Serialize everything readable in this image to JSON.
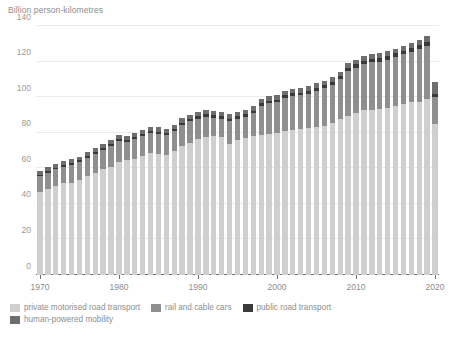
{
  "chart_data": {
    "type": "bar",
    "stacked": true,
    "title": "",
    "subtitle": "",
    "ylabel": "Billion person-kilometres",
    "xlabel": "",
    "ylim": [
      0,
      140
    ],
    "yticks": [
      0,
      20,
      40,
      60,
      80,
      100,
      120,
      140
    ],
    "xticks": [
      "1970",
      "1980",
      "1990",
      "2000",
      "2010",
      "2020"
    ],
    "grid": true,
    "legend_position": "bottom-left",
    "categories": [
      "1970",
      "1971",
      "1972",
      "1973",
      "1974",
      "1975",
      "1976",
      "1977",
      "1978",
      "1979",
      "1980",
      "1981",
      "1982",
      "1983",
      "1984",
      "1985",
      "1986",
      "1987",
      "1988",
      "1989",
      "1990",
      "1991",
      "1992",
      "1993",
      "1994",
      "1995",
      "1996",
      "1997",
      "1998",
      "1999",
      "2000",
      "2001",
      "2002",
      "2003",
      "2004",
      "2005",
      "2006",
      "2007",
      "2008",
      "2009",
      "2010",
      "2011",
      "2012",
      "2013",
      "2014",
      "2015",
      "2016",
      "2017",
      "2018",
      "2019",
      "2020"
    ],
    "series": [
      {
        "name": "private motorised road transport",
        "color": "#cfcfcf",
        "values": [
          46.5,
          48.5,
          50.0,
          51.5,
          52.0,
          53.5,
          55.5,
          57.5,
          59.5,
          61.0,
          63.5,
          64.5,
          65.5,
          67.0,
          68.5,
          68.0,
          67.5,
          69.5,
          72.5,
          74.5,
          76.5,
          77.5,
          78.0,
          77.5,
          73.5,
          76.0,
          77.0,
          78.0,
          78.5,
          79.5,
          80.0,
          81.0,
          81.5,
          82.0,
          82.5,
          83.5,
          84.0,
          85.5,
          87.5,
          89.5,
          91.0,
          92.5,
          93.0,
          93.5,
          94.0,
          95.0,
          96.0,
          97.0,
          97.5,
          99.0,
          85.0
        ]
      },
      {
        "name": "rail and cable cars",
        "color": "#8f8f8f",
        "values": [
          9.0,
          9.0,
          9.5,
          9.5,
          10.0,
          10.0,
          10.5,
          10.5,
          11.0,
          11.5,
          12.0,
          10.5,
          11.0,
          11.0,
          11.5,
          11.5,
          11.0,
          11.5,
          12.0,
          12.0,
          11.5,
          11.5,
          10.5,
          10.5,
          13.0,
          12.0,
          12.0,
          13.0,
          16.5,
          17.0,
          17.0,
          18.5,
          19.0,
          19.0,
          19.5,
          20.0,
          21.0,
          21.5,
          22.5,
          25.0,
          25.5,
          26.0,
          26.5,
          26.5,
          27.0,
          27.5,
          28.0,
          28.5,
          29.5,
          30.0,
          15.0
        ]
      },
      {
        "name": "public road transport",
        "color": "#3a3a3a",
        "values": [
          0.8,
          0.8,
          0.8,
          0.9,
          0.9,
          0.9,
          0.9,
          1.0,
          1.0,
          1.0,
          1.0,
          1.0,
          1.0,
          1.1,
          1.1,
          1.1,
          1.1,
          1.2,
          1.2,
          1.2,
          1.3,
          1.3,
          1.3,
          1.3,
          1.3,
          1.4,
          1.4,
          1.4,
          1.5,
          1.5,
          1.5,
          1.6,
          1.6,
          1.6,
          1.7,
          1.7,
          1.7,
          1.8,
          1.8,
          1.9,
          1.9,
          2.0,
          2.0,
          2.0,
          2.1,
          2.1,
          2.2,
          2.2,
          2.3,
          2.3,
          1.8
        ]
      },
      {
        "name": "human-powered mobility",
        "color": "#6e6e6e",
        "values": [
          2.2,
          2.2,
          2.2,
          2.2,
          2.2,
          2.2,
          2.3,
          2.3,
          2.3,
          2.3,
          2.3,
          2.3,
          2.3,
          2.4,
          2.4,
          2.4,
          2.4,
          2.4,
          2.4,
          2.4,
          2.5,
          2.5,
          2.5,
          2.5,
          2.5,
          2.5,
          2.5,
          2.5,
          2.5,
          2.5,
          2.5,
          2.5,
          2.5,
          2.5,
          2.5,
          2.5,
          2.5,
          2.5,
          2.5,
          2.6,
          2.6,
          2.6,
          2.6,
          2.6,
          2.7,
          2.7,
          2.8,
          2.8,
          3.0,
          3.2,
          6.5
        ]
      }
    ],
    "totals": [
      58.5,
      60.5,
      62.5,
      64.1,
      65.1,
      66.6,
      69.2,
      71.3,
      73.8,
      75.8,
      78.8,
      78.3,
      79.8,
      81.5,
      83.5,
      83.0,
      82.0,
      84.6,
      88.1,
      90.1,
      91.8,
      92.8,
      92.3,
      91.8,
      90.3,
      91.9,
      92.9,
      94.9,
      99.0,
      100.5,
      101.0,
      103.6,
      104.6,
      105.1,
      106.2,
      107.7,
      109.2,
      111.3,
      114.3,
      119.0,
      121.0,
      123.1,
      124.1,
      124.6,
      125.8,
      127.3,
      129.0,
      130.5,
      132.3,
      134.5,
      108.3
    ]
  },
  "legend": {
    "items": [
      {
        "label": "private motorised road transport",
        "color": "#cfcfcf"
      },
      {
        "label": "rail and cable cars",
        "color": "#8f8f8f"
      },
      {
        "label": "public road transport",
        "color": "#3a3a3a"
      },
      {
        "label": "human-powered mobility",
        "color": "#6e6e6e"
      }
    ]
  }
}
